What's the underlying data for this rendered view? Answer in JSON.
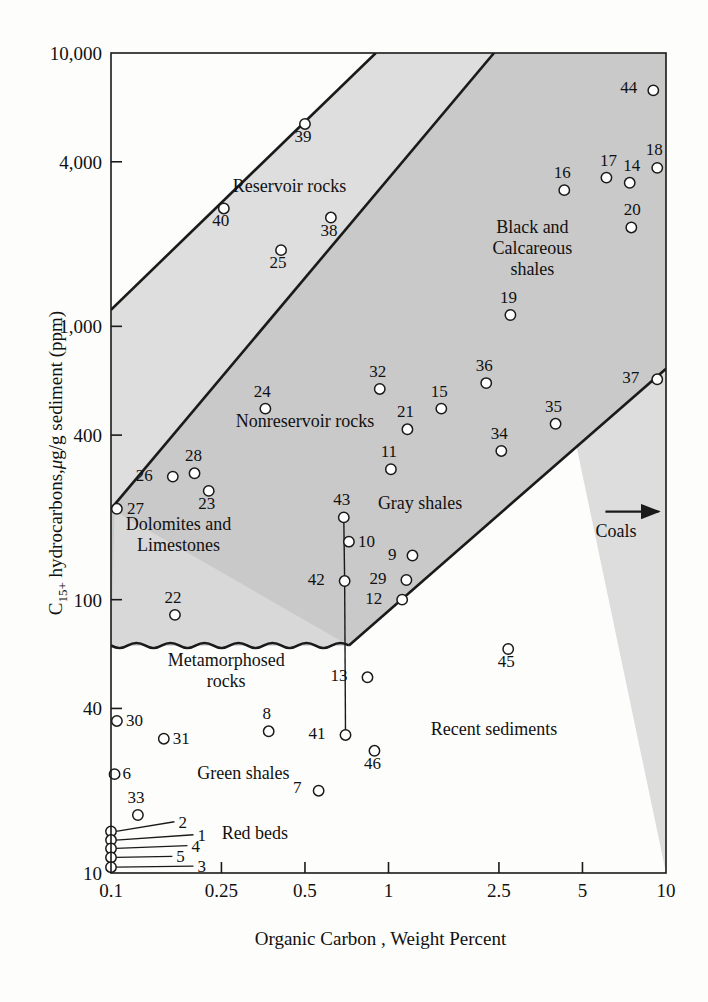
{
  "chart_data": {
    "type": "scatter",
    "title": "",
    "xlabel": "Organic Carbon , Weight Percent",
    "ylabel": "C15+ hydrocarbons, μg/g sediment (ppm)",
    "ylabel_parts": {
      "pre": "C",
      "sub": "15+",
      "post": " hydrocarbons,μg/g sediment (ppm)"
    },
    "xscale": "log",
    "yscale": "log",
    "xlim": [
      0.1,
      10
    ],
    "ylim": [
      10,
      10000
    ],
    "grid": false,
    "legend": "none",
    "xticks": [
      {
        "value": 0.1,
        "label": "0.1"
      },
      {
        "value": 0.25,
        "label": "0.25"
      },
      {
        "value": 0.5,
        "label": "0.5"
      },
      {
        "value": 1,
        "label": "1"
      },
      {
        "value": 2.5,
        "label": "2.5"
      },
      {
        "value": 5,
        "label": "5"
      },
      {
        "value": 10,
        "label": "10"
      }
    ],
    "yticks": [
      {
        "value": 10,
        "label": "10"
      },
      {
        "value": 40,
        "label": "40"
      },
      {
        "value": 100,
        "label": "100"
      },
      {
        "value": 400,
        "label": "400"
      },
      {
        "value": 1000,
        "label": "1,000"
      },
      {
        "value": 4000,
        "label": "4,000"
      },
      {
        "value": 10000,
        "label": "10,000"
      }
    ],
    "zone_labels": [
      {
        "id": "reservoir-rocks",
        "text": [
          "Reservoir rocks"
        ],
        "x": 0.44,
        "y": 3100
      },
      {
        "id": "black-calcareous",
        "text": [
          "Black and",
          "Calcareous",
          "shales"
        ],
        "x": 3.3,
        "y": 2200
      },
      {
        "id": "nonreservoir-rocks",
        "text": [
          "Nonreservoir rocks"
        ],
        "x": 0.5,
        "y": 430
      },
      {
        "id": "gray-shales",
        "text": [
          "Gray shales"
        ],
        "x": 1.3,
        "y": 215
      },
      {
        "id": "dolomites-limestones",
        "text": [
          "Dolomites and",
          "Limestones"
        ],
        "x": 0.175,
        "y": 180
      },
      {
        "id": "metamorphosed-rocks",
        "text": [
          "Metamorphosed",
          "rocks"
        ],
        "x": 0.26,
        "y": 57
      },
      {
        "id": "green-shales",
        "text": [
          "Green shales"
        ],
        "x": 0.3,
        "y": 22
      },
      {
        "id": "red-beds",
        "text": [
          "Red beds"
        ],
        "x": 0.33,
        "y": 13.3
      },
      {
        "id": "recent-sediments",
        "text": [
          "Recent sediments"
        ],
        "x": 2.4,
        "y": 32
      },
      {
        "id": "coals",
        "text": [
          "Coals"
        ],
        "x": 6.6,
        "y": 170
      }
    ],
    "points": [
      {
        "label": "44",
        "x": 9.0,
        "y": 7300,
        "lx": -16,
        "ly": 3
      },
      {
        "label": "18",
        "x": 9.3,
        "y": 3800,
        "lx": -3,
        "ly": -13
      },
      {
        "label": "17",
        "x": 6.1,
        "y": 3500,
        "lx": 2,
        "ly": -12
      },
      {
        "label": "14",
        "x": 7.4,
        "y": 3350,
        "lx": 2,
        "ly": -12
      },
      {
        "label": "16",
        "x": 4.3,
        "y": 3150,
        "lx": -2,
        "ly": -12
      },
      {
        "label": "20",
        "x": 7.5,
        "y": 2300,
        "lx": 1,
        "ly": -12
      },
      {
        "label": "39",
        "x": 0.5,
        "y": 5500,
        "lx": -2,
        "ly": 18
      },
      {
        "label": "40",
        "x": 0.255,
        "y": 2700,
        "lx": -3,
        "ly": 18
      },
      {
        "label": "38",
        "x": 0.62,
        "y": 2500,
        "lx": -2,
        "ly": 18
      },
      {
        "label": "25",
        "x": 0.41,
        "y": 1900,
        "lx": -3,
        "ly": 18
      },
      {
        "label": "19",
        "x": 2.75,
        "y": 1100,
        "lx": -2,
        "ly": -12
      },
      {
        "label": "37",
        "x": 9.3,
        "y": 640,
        "lx": -18,
        "ly": 4
      },
      {
        "label": "36",
        "x": 2.25,
        "y": 620,
        "lx": -2,
        "ly": -12
      },
      {
        "label": "32",
        "x": 0.93,
        "y": 590,
        "lx": -2,
        "ly": -12
      },
      {
        "label": "24",
        "x": 0.36,
        "y": 500,
        "lx": -3,
        "ly": -12
      },
      {
        "label": "15",
        "x": 1.55,
        "y": 500,
        "lx": -2,
        "ly": -12
      },
      {
        "label": "35",
        "x": 4.0,
        "y": 440,
        "lx": -2,
        "ly": -12
      },
      {
        "label": "21",
        "x": 1.17,
        "y": 420,
        "lx": -2,
        "ly": -12
      },
      {
        "label": "34",
        "x": 2.55,
        "y": 350,
        "lx": -2,
        "ly": -12
      },
      {
        "label": "11",
        "x": 1.02,
        "y": 300,
        "lx": -2,
        "ly": -12
      },
      {
        "label": "28",
        "x": 0.2,
        "y": 290,
        "lx": -1,
        "ly": -12
      },
      {
        "label": "26",
        "x": 0.167,
        "y": 282,
        "lx": -20,
        "ly": 4
      },
      {
        "label": "23",
        "x": 0.225,
        "y": 250,
        "lx": -2,
        "ly": 18
      },
      {
        "label": "27",
        "x": 0.105,
        "y": 215,
        "lx": 10,
        "ly": 5
      },
      {
        "label": "43",
        "x": 0.69,
        "y": 200,
        "lx": -2,
        "ly": -12
      },
      {
        "label": "10",
        "x": 0.72,
        "y": 163,
        "lx": 9,
        "ly": 5
      },
      {
        "label": "9",
        "x": 1.22,
        "y": 145,
        "lx": -16,
        "ly": 4
      },
      {
        "label": "29",
        "x": 1.16,
        "y": 118,
        "lx": -20,
        "ly": 4
      },
      {
        "label": "42",
        "x": 0.695,
        "y": 117,
        "lx": -20,
        "ly": 4
      },
      {
        "label": "12",
        "x": 1.12,
        "y": 100,
        "lx": -20,
        "ly": 4
      },
      {
        "label": "22",
        "x": 0.17,
        "y": 88,
        "lx": -2,
        "ly": -12
      },
      {
        "label": "45",
        "x": 2.7,
        "y": 66,
        "lx": -2,
        "ly": 18
      },
      {
        "label": "13",
        "x": 0.84,
        "y": 52,
        "lx": -20,
        "ly": 4
      },
      {
        "label": "30",
        "x": 0.105,
        "y": 36,
        "lx": 9,
        "ly": 5
      },
      {
        "label": "8",
        "x": 0.37,
        "y": 33,
        "lx": -2,
        "ly": -12
      },
      {
        "label": "31",
        "x": 0.155,
        "y": 31,
        "lx": 9,
        "ly": 5
      },
      {
        "label": "41",
        "x": 0.7,
        "y": 32,
        "lx": -20,
        "ly": 4
      },
      {
        "label": "46",
        "x": 0.89,
        "y": 28,
        "lx": -2,
        "ly": 18
      },
      {
        "label": "6",
        "x": 0.103,
        "y": 23,
        "lx": 8,
        "ly": 5
      },
      {
        "label": "7",
        "x": 0.56,
        "y": 20,
        "lx": -17,
        "ly": 2
      },
      {
        "label": "33",
        "x": 0.125,
        "y": 16.3,
        "lx": -2,
        "ly": -12
      }
    ],
    "stacked_points": [
      {
        "label": "2",
        "x": 0.1,
        "y": 14.2,
        "label_x": 0.175,
        "label_y": 15.4
      },
      {
        "label": "1",
        "x": 0.1,
        "y": 13.2,
        "label_x": 0.205,
        "label_y": 13.8
      },
      {
        "label": "4",
        "x": 0.1,
        "y": 12.3,
        "label_x": 0.195,
        "label_y": 12.6
      },
      {
        "label": "5",
        "x": 0.1,
        "y": 11.4,
        "label_x": 0.172,
        "label_y": 11.5
      },
      {
        "label": "3",
        "x": 0.1,
        "y": 10.5,
        "label_x": 0.205,
        "label_y": 10.6
      }
    ],
    "connectors": [
      {
        "from": "43",
        "to": "42"
      },
      {
        "from": "42",
        "to": "41"
      }
    ],
    "boundaries": [
      {
        "id": "reservoir-upper",
        "p1x": 0.1,
        "p1y": 1150,
        "p2x": 0.9,
        "p2y": 10000
      },
      {
        "id": "reservoir-lower",
        "p1x": 0.1,
        "p1y": 215,
        "p2x": 2.4,
        "p2y": 10000
      },
      {
        "id": "graysh-lower",
        "p1x": 0.72,
        "p1y": 68,
        "p2x": 10.0,
        "p2y": 700
      }
    ],
    "wavy_boundary": {
      "y": 68,
      "x_start": 0.1,
      "x_end": 0.72
    },
    "zone_fills": {
      "reservoir_band": "#dddddd",
      "nonreservoir_band": "#d3d3d3",
      "dark_band": "#bdbdbd",
      "background": "#ffffff"
    },
    "colors": {
      "axis": "#1a1a1a",
      "marker_stroke": "#1a1a1a",
      "text": "#111111"
    },
    "coals_arrow": {
      "x1": 6.05,
      "y1": 210,
      "x2": 9.4,
      "y2": 210
    }
  }
}
